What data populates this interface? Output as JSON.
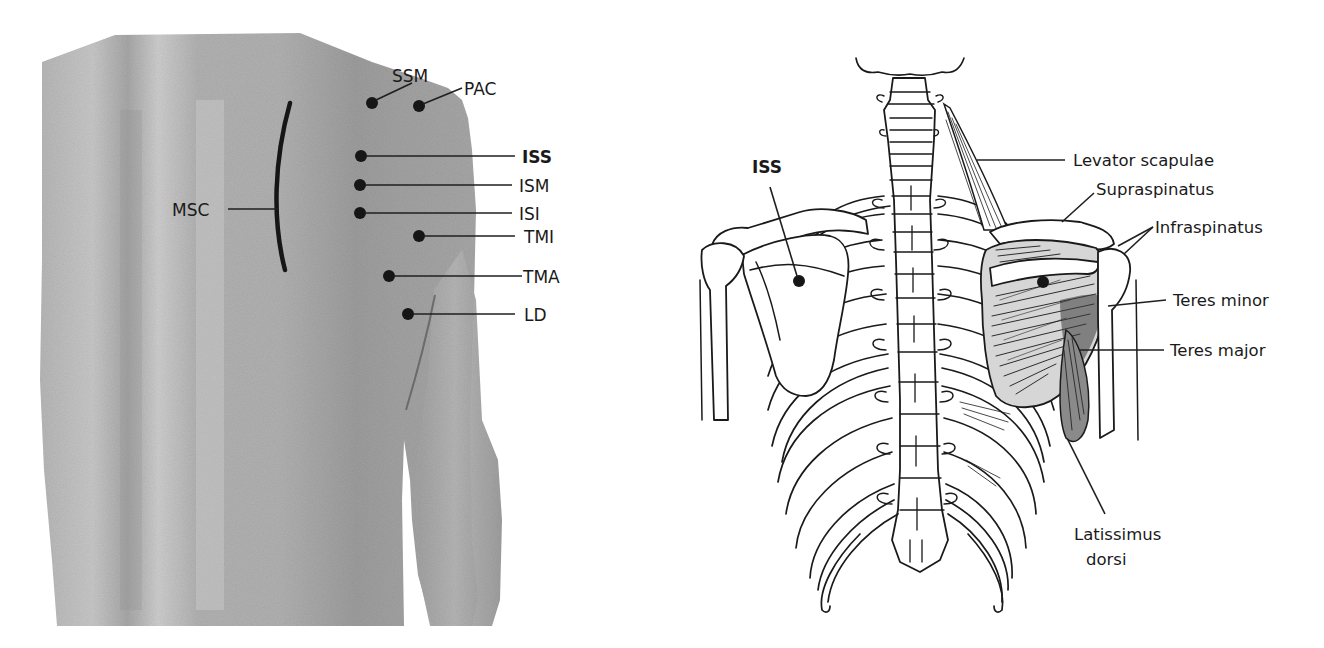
{
  "figure": {
    "left_panel": {
      "description": "Back photograph with palpation points",
      "skin_color": "#a9a9a9",
      "points": [
        {
          "id": "SSM",
          "label": "SSM",
          "bold": false
        },
        {
          "id": "PAC",
          "label": "PAC",
          "bold": false
        },
        {
          "id": "ISS",
          "label": "ISS",
          "bold": true
        },
        {
          "id": "ISM",
          "label": "ISM",
          "bold": false
        },
        {
          "id": "ISI",
          "label": "ISI",
          "bold": false
        },
        {
          "id": "TMI",
          "label": "TMI",
          "bold": false
        },
        {
          "id": "TMA",
          "label": "TMA",
          "bold": false
        },
        {
          "id": "LD",
          "label": "LD",
          "bold": false
        }
      ],
      "line_marker": {
        "id": "MSC",
        "label": "MSC"
      }
    },
    "right_panel": {
      "description": "Posterior skeleton and shoulder muscles line drawing",
      "point_label": {
        "label": "ISS",
        "bold": true
      },
      "muscle_labels": [
        {
          "id": "levator",
          "label": "Levator scapulae"
        },
        {
          "id": "supra",
          "label": "Supraspinatus"
        },
        {
          "id": "infra",
          "label": "Infraspinatus"
        },
        {
          "id": "teres-minor",
          "label": "Teres minor"
        },
        {
          "id": "teres-major",
          "label": "Teres major"
        },
        {
          "id": "lat-1",
          "label": "Latissimus"
        },
        {
          "id": "lat-2",
          "label": "dorsi"
        }
      ]
    },
    "colors": {
      "ink": "#1a1a1a",
      "skin_light": "#c4c4c4",
      "skin_mid": "#a8a8a8",
      "skin_dark": "#8c8c8c",
      "background": "#ffffff"
    }
  }
}
